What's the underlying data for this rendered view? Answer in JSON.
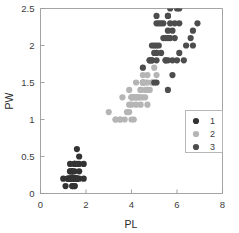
{
  "chart_data": {
    "type": "scatter",
    "title": "",
    "subtitle": "",
    "xlabel": "PL",
    "ylabel": "PW",
    "xlim": [
      0,
      8
    ],
    "ylim": [
      0,
      2.5
    ],
    "xticks": [
      0,
      2,
      4,
      6,
      8
    ],
    "yticks": [
      0,
      0.5,
      1,
      1.5,
      2,
      2.5
    ],
    "xtick_labels": [
      "0",
      "2",
      "4",
      "6",
      "8"
    ],
    "ytick_labels": [
      "0",
      "0.5",
      "1",
      "1.5",
      "2",
      "2.5"
    ],
    "grid": false,
    "legend_position": "lower-right",
    "marker": "circle",
    "marker_size": 3.1,
    "colors": {
      "class1": "#333333",
      "class2": "#b5b5b5",
      "class3": "#4d4d4d",
      "axis": "#9a9a9a",
      "text": "#3c3c3c",
      "background": "#ffffff",
      "legend_border": "#b0b0b0"
    },
    "series": [
      {
        "name": "1",
        "legend_label": "1",
        "color": "#333333",
        "points": [
          [
            1.4,
            0.2
          ],
          [
            1.4,
            0.2
          ],
          [
            1.3,
            0.2
          ],
          [
            1.5,
            0.2
          ],
          [
            1.4,
            0.2
          ],
          [
            1.7,
            0.4
          ],
          [
            1.4,
            0.3
          ],
          [
            1.5,
            0.2
          ],
          [
            1.4,
            0.2
          ],
          [
            1.5,
            0.1
          ],
          [
            1.5,
            0.2
          ],
          [
            1.6,
            0.2
          ],
          [
            1.4,
            0.1
          ],
          [
            1.1,
            0.1
          ],
          [
            1.2,
            0.2
          ],
          [
            1.5,
            0.4
          ],
          [
            1.3,
            0.4
          ],
          [
            1.4,
            0.3
          ],
          [
            1.7,
            0.3
          ],
          [
            1.5,
            0.3
          ],
          [
            1.7,
            0.2
          ],
          [
            1.5,
            0.4
          ],
          [
            1.0,
            0.2
          ],
          [
            1.7,
            0.5
          ],
          [
            1.9,
            0.2
          ],
          [
            1.6,
            0.2
          ],
          [
            1.6,
            0.4
          ],
          [
            1.5,
            0.2
          ],
          [
            1.4,
            0.2
          ],
          [
            1.6,
            0.2
          ],
          [
            1.6,
            0.2
          ],
          [
            1.5,
            0.4
          ],
          [
            1.5,
            0.1
          ],
          [
            1.4,
            0.2
          ],
          [
            1.5,
            0.2
          ],
          [
            1.2,
            0.2
          ],
          [
            1.3,
            0.2
          ],
          [
            1.4,
            0.1
          ],
          [
            1.3,
            0.2
          ],
          [
            1.5,
            0.2
          ],
          [
            1.3,
            0.3
          ],
          [
            1.3,
            0.3
          ],
          [
            1.3,
            0.2
          ],
          [
            1.6,
            0.6
          ],
          [
            1.9,
            0.4
          ],
          [
            1.4,
            0.3
          ],
          [
            1.6,
            0.2
          ],
          [
            1.4,
            0.2
          ],
          [
            1.5,
            0.2
          ],
          [
            1.4,
            0.2
          ]
        ]
      },
      {
        "name": "2",
        "legend_label": "2",
        "color": "#b5b5b5",
        "points": [
          [
            4.7,
            1.4
          ],
          [
            4.5,
            1.5
          ],
          [
            4.9,
            1.5
          ],
          [
            4.0,
            1.3
          ],
          [
            4.6,
            1.5
          ],
          [
            4.5,
            1.3
          ],
          [
            4.7,
            1.6
          ],
          [
            3.3,
            1.0
          ],
          [
            4.6,
            1.3
          ],
          [
            3.9,
            1.4
          ],
          [
            3.5,
            1.0
          ],
          [
            4.2,
            1.5
          ],
          [
            4.0,
            1.0
          ],
          [
            4.7,
            1.4
          ],
          [
            3.6,
            1.3
          ],
          [
            4.4,
            1.4
          ],
          [
            4.5,
            1.5
          ],
          [
            4.1,
            1.0
          ],
          [
            4.5,
            1.5
          ],
          [
            3.9,
            1.1
          ],
          [
            4.8,
            1.8
          ],
          [
            4.0,
            1.3
          ],
          [
            4.9,
            1.5
          ],
          [
            4.7,
            1.2
          ],
          [
            4.3,
            1.3
          ],
          [
            4.4,
            1.4
          ],
          [
            4.8,
            1.4
          ],
          [
            5.0,
            1.7
          ],
          [
            4.5,
            1.5
          ],
          [
            3.5,
            1.0
          ],
          [
            3.8,
            1.1
          ],
          [
            3.7,
            1.0
          ],
          [
            3.9,
            1.2
          ],
          [
            5.1,
            1.6
          ],
          [
            4.5,
            1.5
          ],
          [
            4.5,
            1.6
          ],
          [
            4.7,
            1.5
          ],
          [
            4.4,
            1.3
          ],
          [
            4.1,
            1.3
          ],
          [
            4.0,
            1.3
          ],
          [
            4.4,
            1.2
          ],
          [
            4.6,
            1.4
          ],
          [
            4.0,
            1.2
          ],
          [
            3.3,
            1.0
          ],
          [
            4.2,
            1.3
          ],
          [
            4.2,
            1.2
          ],
          [
            4.2,
            1.3
          ],
          [
            4.3,
            1.3
          ],
          [
            3.0,
            1.1
          ],
          [
            4.1,
            1.3
          ]
        ]
      },
      {
        "name": "3",
        "legend_label": "3",
        "color": "#4d4d4d",
        "points": [
          [
            6.0,
            2.5
          ],
          [
            5.1,
            1.9
          ],
          [
            5.9,
            2.1
          ],
          [
            5.6,
            1.8
          ],
          [
            5.8,
            2.2
          ],
          [
            6.6,
            2.1
          ],
          [
            4.5,
            1.7
          ],
          [
            6.3,
            1.8
          ],
          [
            5.8,
            1.8
          ],
          [
            6.1,
            2.5
          ],
          [
            5.1,
            2.0
          ],
          [
            5.3,
            1.9
          ],
          [
            5.5,
            2.1
          ],
          [
            5.0,
            2.0
          ],
          [
            5.1,
            2.4
          ],
          [
            5.3,
            2.3
          ],
          [
            5.5,
            1.8
          ],
          [
            6.7,
            2.2
          ],
          [
            6.9,
            2.3
          ],
          [
            5.0,
            1.5
          ],
          [
            5.7,
            2.3
          ],
          [
            4.9,
            2.0
          ],
          [
            6.7,
            2.0
          ],
          [
            4.9,
            1.8
          ],
          [
            5.7,
            2.1
          ],
          [
            6.0,
            1.8
          ],
          [
            4.8,
            1.8
          ],
          [
            4.9,
            1.8
          ],
          [
            5.6,
            2.1
          ],
          [
            5.8,
            1.6
          ],
          [
            6.1,
            1.9
          ],
          [
            6.4,
            2.0
          ],
          [
            5.6,
            2.2
          ],
          [
            5.1,
            1.5
          ],
          [
            5.6,
            1.4
          ],
          [
            6.1,
            2.3
          ],
          [
            5.6,
            2.4
          ],
          [
            5.5,
            1.8
          ],
          [
            4.8,
            1.8
          ],
          [
            5.4,
            2.1
          ],
          [
            5.6,
            2.4
          ],
          [
            5.1,
            2.3
          ],
          [
            5.1,
            1.9
          ],
          [
            5.9,
            2.3
          ],
          [
            5.7,
            2.5
          ],
          [
            5.2,
            2.3
          ],
          [
            5.0,
            1.9
          ],
          [
            5.2,
            2.0
          ],
          [
            5.4,
            2.3
          ],
          [
            5.1,
            1.8
          ]
        ]
      }
    ]
  },
  "legend": {
    "entries": [
      {
        "label": "1"
      },
      {
        "label": "2"
      },
      {
        "label": "3"
      }
    ]
  },
  "axes": {
    "x_title": "PL",
    "y_title": "PW"
  }
}
